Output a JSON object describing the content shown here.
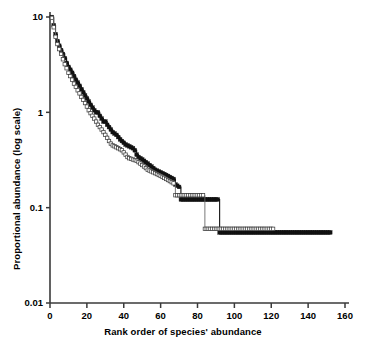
{
  "chart_data": {
    "type": "line",
    "title": "",
    "xlabel": "Rank order of species' abundance",
    "ylabel": "Proportional abundance (log scale)",
    "xlim": [
      0,
      160
    ],
    "ylim": [
      0.01,
      10
    ],
    "yscale": "log",
    "grid": false,
    "legend": "none",
    "xticks": [
      "0",
      "20",
      "40",
      "60",
      "80",
      "100",
      "120",
      "140",
      "160"
    ],
    "xtick_values": [
      0,
      20,
      40,
      60,
      80,
      100,
      120,
      140,
      160
    ],
    "yticks": [
      "10",
      "1",
      "0.1",
      "0.01"
    ],
    "ytick_values": [
      10,
      1,
      0.1,
      0.01
    ],
    "series": [
      {
        "name": "filled-squares-series",
        "marker": "filled-square",
        "color": "#111111",
        "step": true,
        "x": [
          1,
          2,
          3,
          4,
          5,
          6,
          7,
          8,
          9,
          10,
          11,
          12,
          13,
          14,
          15,
          16,
          17,
          18,
          19,
          20,
          21,
          22,
          23,
          24,
          25,
          26,
          27,
          28,
          29,
          30,
          31,
          32,
          33,
          34,
          35,
          36,
          37,
          38,
          39,
          40,
          41,
          42,
          43,
          44,
          45,
          46,
          47,
          48,
          49,
          50,
          51,
          52,
          53,
          54,
          55,
          56,
          57,
          58,
          59,
          60,
          61,
          62,
          63,
          64,
          65,
          66,
          67,
          68,
          69,
          70,
          71,
          72,
          73,
          74,
          75,
          76,
          77,
          78,
          79,
          80,
          81,
          82,
          83,
          84,
          85,
          86,
          87,
          88,
          89,
          90,
          91,
          92,
          100,
          110,
          120,
          130,
          140,
          150,
          152
        ],
        "y": [
          10.0,
          8.2,
          6.6,
          5.6,
          5.0,
          4.5,
          4.1,
          3.7,
          3.3,
          3.0,
          2.8,
          2.6,
          2.4,
          2.2,
          2.05,
          1.9,
          1.75,
          1.62,
          1.5,
          1.4,
          1.3,
          1.2,
          1.12,
          1.05,
          1.0,
          1.0,
          0.92,
          0.86,
          0.8,
          0.8,
          0.74,
          0.7,
          0.66,
          0.62,
          0.6,
          0.58,
          0.55,
          0.52,
          0.5,
          0.48,
          0.46,
          0.45,
          0.44,
          0.43,
          0.42,
          0.4,
          0.36,
          0.34,
          0.33,
          0.32,
          0.31,
          0.3,
          0.29,
          0.28,
          0.27,
          0.26,
          0.25,
          0.245,
          0.24,
          0.235,
          0.23,
          0.225,
          0.22,
          0.215,
          0.21,
          0.205,
          0.2,
          0.175,
          0.17,
          0.165,
          0.122,
          0.122,
          0.122,
          0.122,
          0.122,
          0.122,
          0.122,
          0.122,
          0.122,
          0.122,
          0.122,
          0.122,
          0.122,
          0.122,
          0.122,
          0.122,
          0.122,
          0.122,
          0.122,
          0.122,
          0.122,
          0.055,
          0.055,
          0.055,
          0.055,
          0.055,
          0.055,
          0.055,
          0.055
        ]
      },
      {
        "name": "open-squares-series",
        "marker": "open-square",
        "color": "#ffffff",
        "edgecolor": "#444444",
        "step": true,
        "x": [
          1,
          2,
          3,
          4,
          5,
          6,
          7,
          8,
          9,
          10,
          11,
          12,
          13,
          14,
          15,
          16,
          17,
          18,
          19,
          20,
          21,
          22,
          23,
          24,
          25,
          26,
          27,
          28,
          29,
          30,
          31,
          32,
          33,
          34,
          35,
          36,
          37,
          38,
          39,
          40,
          41,
          42,
          43,
          44,
          45,
          46,
          47,
          48,
          49,
          50,
          51,
          52,
          53,
          54,
          55,
          56,
          57,
          58,
          59,
          60,
          61,
          62,
          63,
          64,
          65,
          66,
          67,
          68,
          69,
          70,
          71,
          72,
          73,
          74,
          75,
          76,
          77,
          78,
          79,
          80,
          81,
          82,
          83,
          84,
          90,
          100,
          110,
          115,
          120,
          121
        ],
        "y": [
          9.8,
          7.8,
          6.2,
          5.2,
          4.6,
          4.1,
          3.6,
          3.2,
          2.9,
          2.6,
          2.4,
          2.2,
          2.0,
          1.85,
          1.7,
          1.58,
          1.45,
          1.35,
          1.25,
          1.15,
          1.05,
          0.98,
          0.92,
          0.86,
          0.8,
          0.74,
          0.7,
          0.66,
          0.62,
          0.58,
          0.54,
          0.5,
          0.47,
          0.45,
          0.44,
          0.43,
          0.42,
          0.41,
          0.4,
          0.38,
          0.36,
          0.34,
          0.33,
          0.325,
          0.32,
          0.315,
          0.31,
          0.3,
          0.29,
          0.28,
          0.27,
          0.26,
          0.25,
          0.245,
          0.24,
          0.235,
          0.23,
          0.225,
          0.22,
          0.215,
          0.21,
          0.205,
          0.2,
          0.195,
          0.19,
          0.185,
          0.18,
          0.135,
          0.135,
          0.135,
          0.135,
          0.135,
          0.135,
          0.135,
          0.135,
          0.135,
          0.135,
          0.135,
          0.135,
          0.135,
          0.135,
          0.135,
          0.135,
          0.06,
          0.06,
          0.06,
          0.06,
          0.06,
          0.06,
          0.06
        ]
      }
    ]
  },
  "axes": {
    "x_title": "Rank order of species' abundance",
    "y_title": "Proportional abundance (log scale)"
  }
}
